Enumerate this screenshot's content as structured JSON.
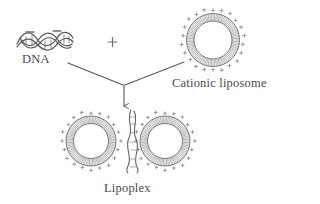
{
  "figure": {
    "background_color": "#ffffff",
    "line_color": "#5a5a5a",
    "text_color": "#4b4b4b"
  },
  "labels": {
    "dna": "DNA",
    "cationic_liposome": "Cationic liposome",
    "lipoplex": "Lipoplex",
    "plus_operator": "+"
  },
  "charges": {
    "dna_charge_symbol": "−",
    "liposome_charge_symbol": "+",
    "dna_charge_count": 2,
    "liposome_outer_charge_count": 22
  },
  "elements": {
    "dna_helix": {
      "name": "DNA double helix",
      "x": 16,
      "y": 30,
      "width": 58,
      "height": 20,
      "strands": 2,
      "wave_periods": 2.5
    },
    "cationic_liposome": {
      "name": "Cationic liposome vesicle",
      "center_x": 213,
      "center_y": 40,
      "outer_radius": 31,
      "inner_radius": 19,
      "lipid_tail_count": 96
    },
    "lipoplex": {
      "name": "Lipoplex complex",
      "liposomes": [
        {
          "center_x": 91,
          "center_y": 141,
          "outer_radius": 29,
          "inner_radius": 18
        },
        {
          "center_x": 165,
          "center_y": 141,
          "outer_radius": 29,
          "inner_radius": 18
        }
      ],
      "bound_dna": {
        "x": 128,
        "y": 110,
        "width": 12,
        "height": 62
      }
    },
    "arrows": [
      {
        "name": "dna-to-junction",
        "x1": 68,
        "y1": 63,
        "x2": 124,
        "y2": 86
      },
      {
        "name": "liposome-to-junction",
        "x1": 183,
        "y1": 63,
        "x2": 124,
        "y2": 86
      },
      {
        "name": "junction-to-lipoplex",
        "x1": 124,
        "y1": 86,
        "x2": 124,
        "y2": 110
      }
    ]
  }
}
